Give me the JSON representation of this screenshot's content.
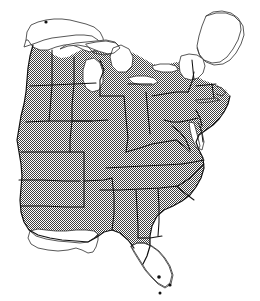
{
  "figure": {
    "kind": "distribution-range-map",
    "region": "Eastern United States",
    "title": "",
    "caption": "",
    "style": "monochrome line art with dithered gray stipple range fill",
    "width": 260,
    "height": 301
  },
  "colors": {
    "background": "#ffffff",
    "range_fill_gray": "#8c8c8c",
    "stipple_dot": "#444444",
    "state_border": "#111111",
    "coastline": "#3a3a3a",
    "unshaded_area": "#ffffff",
    "locality_dot": "#111111"
  },
  "legend": {
    "present": false,
    "entries": []
  },
  "labels": {
    "present": false,
    "items": []
  },
  "chart_data": {
    "type": "map",
    "title": "",
    "xlabel": "",
    "ylabel": "",
    "projection": "unprojected outline of eastern United States",
    "encoding": {
      "shaded": "within range",
      "unshaded": "outside range / water"
    },
    "categories": [
      "shaded",
      "unshaded",
      "water"
    ],
    "values": [
      31,
      5,
      5
    ],
    "shaded_regions": [
      "North Dakota",
      "South Dakota",
      "Nebraska",
      "Kansas",
      "Oklahoma",
      "Texas (northeast corner)",
      "Iowa",
      "Missouri",
      "Arkansas",
      "Wisconsin",
      "Illinois",
      "Michigan",
      "Indiana",
      "Ohio",
      "Kentucky",
      "Tennessee",
      "Mississippi",
      "Alabama",
      "Georgia",
      "Florida (northern and central)",
      "South Carolina",
      "North Carolina",
      "Virginia",
      "West Virginia",
      "Maryland",
      "Delaware",
      "Pennsylvania",
      "New Jersey",
      "New York",
      "Connecticut",
      "Rhode Island",
      "Massachusetts",
      "Vermont (southern)",
      "New Hampshire (southern)"
    ],
    "unshaded_regions": [
      "Minnesota",
      "Louisiana",
      "Maine",
      "Florida (southern tip and Keys)",
      "Vermont (northern)",
      "New Hampshire (northern)"
    ],
    "water_bodies": [
      "Lake Superior",
      "Lake Michigan",
      "Lake Huron",
      "Lake Erie",
      "Lake Ontario",
      "Chesapeake Bay",
      "Atlantic Ocean",
      "Gulf of Mexico"
    ],
    "locality_dots": [
      {
        "name": "northern-minnesota",
        "x": 46,
        "y": 22
      },
      {
        "name": "south-florida",
        "x": 159,
        "y": 277
      },
      {
        "name": "southeast-florida",
        "x": 170,
        "y": 285
      },
      {
        "name": "florida-keys",
        "x": 160,
        "y": 293
      }
    ]
  }
}
